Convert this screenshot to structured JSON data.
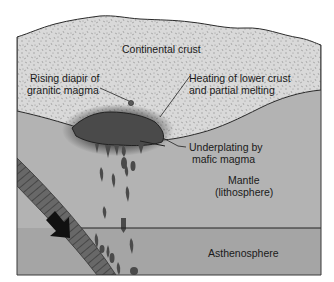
{
  "diagram": {
    "layers": {
      "continental_crust": "Continental crust",
      "mantle_line1": "Mantle",
      "mantle_line2": "(lithosphere)",
      "asthenosphere": "Asthenosphere"
    },
    "annotations": {
      "diapir_line1": "Rising diapir of",
      "diapir_line2": "granitic magma",
      "heating_line1": "Heating of lower crust",
      "heating_line2": "and partial melting",
      "underplating_line1": "Underplating by",
      "underplating_line2": "mafic magma"
    },
    "icons": {
      "subduction_arrow": "arrow-down-right-icon"
    },
    "colors": {
      "background": "#ffffff",
      "crust": "#d8d8d8",
      "crust_speckle": "#8a8a8a",
      "mantle": "#b3b3b3",
      "asthenosphere": "#a4a4a4",
      "magma": "#4a4a4a",
      "slab": "#606060",
      "outline": "#2a2a2a",
      "text": "#1a1a1a"
    }
  }
}
